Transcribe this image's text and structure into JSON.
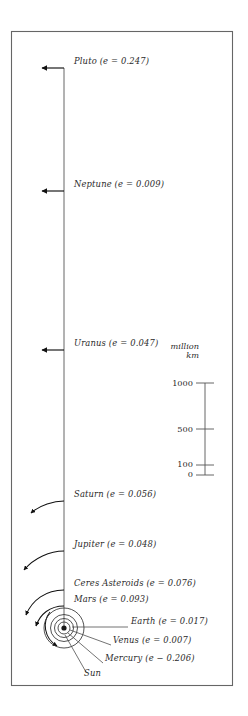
{
  "figure": {
    "frame": {
      "x": 11,
      "y": 31,
      "width": 222,
      "height": 655,
      "color": "#666666"
    },
    "axis_line": {
      "x": 64,
      "y_top": 68,
      "y_bottom": 628,
      "color": "#555555"
    },
    "bodies": [
      {
        "name": "Pluto",
        "label": "Pluto (e = 0.247)",
        "eccentricity": 0.247,
        "label_x": 74,
        "label_y": 62,
        "marker_y": 68,
        "pointer": "arrow-left"
      },
      {
        "name": "Neptune",
        "label": "Neptune (e = 0.009)",
        "eccentricity": 0.009,
        "label_x": 74,
        "label_y": 185,
        "marker_y": 191,
        "pointer": "arrow-left"
      },
      {
        "name": "Uranus",
        "label": "Uranus (e = 0.047)",
        "eccentricity": 0.047,
        "label_x": 74,
        "label_y": 344,
        "marker_y": 350,
        "pointer": "arrow-left"
      },
      {
        "name": "Saturn",
        "label": "Saturn (e = 0.056)",
        "eccentricity": 0.056,
        "label_x": 74,
        "label_y": 495,
        "marker_y": 501,
        "pointer": "curve-left"
      },
      {
        "name": "Jupiter",
        "label": "Jupiter (e = 0.048)",
        "eccentricity": 0.048,
        "label_x": 74,
        "label_y": 545,
        "marker_y": 551,
        "pointer": "curve-left"
      },
      {
        "name": "Ceres Asteroids",
        "label": "Ceres Asteroids (e = 0.076)",
        "eccentricity": 0.076,
        "label_x": 74,
        "label_y": 584,
        "marker_y": 590,
        "pointer": "curve-left"
      },
      {
        "name": "Mars",
        "label": "Mars (e = 0.093)",
        "eccentricity": 0.093,
        "label_x": 74,
        "label_y": 600,
        "marker_y": 606,
        "pointer": "curve-left"
      },
      {
        "name": "Earth",
        "label": "Earth (e = 0.017)",
        "eccentricity": 0.017,
        "label_x": 131,
        "label_y": 622,
        "marker_y": 628,
        "pointer": "leader-line"
      },
      {
        "name": "Venus",
        "label": "Venus (e = 0.007)",
        "eccentricity": 0.007,
        "label_x": 113,
        "label_y": 641,
        "marker_y": 628,
        "pointer": "leader-line"
      },
      {
        "name": "Mercury",
        "label": "Mercury (e − 0.206)",
        "eccentricity": 0.206,
        "label_x": 105,
        "label_y": 659,
        "marker_y": 628,
        "pointer": "leader-line"
      },
      {
        "name": "Sun",
        "label": "Sun",
        "eccentricity": null,
        "label_x": 84,
        "label_y": 674,
        "marker_y": 628,
        "pointer": "leader-line"
      }
    ],
    "orbit_rings": [
      {
        "name": "mars-orbit",
        "radius": 20.0
      },
      {
        "name": "earth-orbit",
        "radius": 13.5
      },
      {
        "name": "venus-orbit",
        "radius": 9.5
      },
      {
        "name": "mercury-orbit",
        "radius": 6.0
      },
      {
        "name": "sun-core",
        "radius": 2.6
      }
    ],
    "scale_bar": {
      "unit_line_1": "million",
      "unit_line_2": "km",
      "unit_x": 175,
      "unit_y": 348,
      "axis_x": 205,
      "y_top": 383,
      "y_bottom": 475,
      "ticks": [
        {
          "value": "1000",
          "y": 383
        },
        {
          "value": "500",
          "y": 429
        },
        {
          "value": "100",
          "y": 465
        },
        {
          "value": "0",
          "y": 475
        }
      ],
      "tick_half_width": 9,
      "color": "#555555"
    }
  }
}
